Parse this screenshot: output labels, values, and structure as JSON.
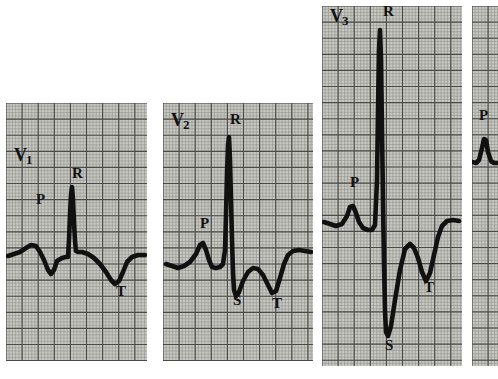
{
  "figure": {
    "kind": "ecg-strip-figure",
    "background_color": "#ffffff",
    "paper_color": "#c9c9c4",
    "trace_color": "#111111",
    "grid_minor_color": "#8e8e88",
    "grid_major_color": "#4a4a46",
    "width": 498,
    "height": 379
  },
  "chart_data": {
    "type": "line",
    "title": "",
    "xlabel": "",
    "ylabel": "",
    "grid": true,
    "legend_position": "none",
    "panels": [
      {
        "lead_label": "V1",
        "lead_label_display": "V",
        "lead_label_subscript": "1",
        "panel_rect": [
          6,
          103,
          141,
          258
        ],
        "baseline_y": 256,
        "annotations": [
          {
            "text": "P",
            "x": 36,
            "y": 204
          },
          {
            "text": "R",
            "x": 72,
            "y": 178
          },
          {
            "text": "T",
            "x": 116,
            "y": 296
          }
        ],
        "features": {
          "p_wave": {
            "amplitude": "small-positive",
            "peak_y": 246
          },
          "q_wave": {
            "amplitude": "small-negative",
            "trough_y": 275
          },
          "r_wave": {
            "amplitude": "tall-narrow-positive",
            "peak_y": 186
          },
          "s_wave": {
            "amplitude": "none"
          },
          "t_wave": {
            "amplitude": "broad-inverted",
            "trough_y": 284
          }
        },
        "points": [
          [
            8,
            256
          ],
          [
            14,
            254
          ],
          [
            20,
            252
          ],
          [
            26,
            248
          ],
          [
            31,
            245
          ],
          [
            36,
            246
          ],
          [
            40,
            252
          ],
          [
            44,
            260
          ],
          [
            48,
            270
          ],
          [
            51,
            274
          ],
          [
            54,
            270
          ],
          [
            57,
            261
          ],
          [
            62,
            258
          ],
          [
            66,
            257
          ],
          [
            68,
            257
          ],
          [
            69,
            240
          ],
          [
            70,
            215
          ],
          [
            71,
            195
          ],
          [
            72,
            187
          ],
          [
            73,
            200
          ],
          [
            74,
            222
          ],
          [
            75,
            241
          ],
          [
            76,
            251
          ],
          [
            78,
            252
          ],
          [
            82,
            252
          ],
          [
            88,
            254
          ],
          [
            94,
            258
          ],
          [
            100,
            264
          ],
          [
            106,
            272
          ],
          [
            111,
            280
          ],
          [
            115,
            284
          ],
          [
            119,
            281
          ],
          [
            123,
            272
          ],
          [
            127,
            262
          ],
          [
            132,
            257
          ],
          [
            138,
            255
          ],
          [
            145,
            255
          ]
        ]
      },
      {
        "lead_label": "V2",
        "lead_label_display": "V",
        "lead_label_subscript": "2",
        "panel_rect": [
          163,
          103,
          150,
          258
        ],
        "baseline_y": 262,
        "annotations": [
          {
            "text": "V2",
            "x": 171,
            "y": 126
          },
          {
            "text": "P",
            "x": 200,
            "y": 228
          },
          {
            "text": "R",
            "x": 230,
            "y": 124
          },
          {
            "text": "S",
            "x": 233,
            "y": 305
          },
          {
            "text": "T",
            "x": 272,
            "y": 308
          }
        ],
        "features": {
          "p_wave": {
            "amplitude": "positive",
            "peak_y": 243
          },
          "r_wave": {
            "amplitude": "very-tall-narrow-positive",
            "peak_y": 136
          },
          "s_wave": {
            "amplitude": "deep-negative",
            "trough_y": 297
          },
          "t_wave": {
            "amplitude": "biphasic-inverted",
            "trough_y": 295
          }
        },
        "points": [
          [
            166,
            264
          ],
          [
            172,
            266
          ],
          [
            178,
            268
          ],
          [
            184,
            266
          ],
          [
            190,
            262
          ],
          [
            196,
            254
          ],
          [
            200,
            245
          ],
          [
            203,
            243
          ],
          [
            206,
            250
          ],
          [
            209,
            260
          ],
          [
            212,
            267
          ],
          [
            216,
            268
          ],
          [
            220,
            267
          ],
          [
            223,
            264
          ],
          [
            225,
            250
          ],
          [
            226,
            215
          ],
          [
            227,
            175
          ],
          [
            228,
            145
          ],
          [
            229,
            137
          ],
          [
            230,
            160
          ],
          [
            231,
            200
          ],
          [
            232,
            240
          ],
          [
            233,
            272
          ],
          [
            234,
            290
          ],
          [
            236,
            296
          ],
          [
            239,
            292
          ],
          [
            243,
            281
          ],
          [
            248,
            272
          ],
          [
            253,
            268
          ],
          [
            258,
            269
          ],
          [
            263,
            275
          ],
          [
            268,
            285
          ],
          [
            272,
            293
          ],
          [
            276,
            291
          ],
          [
            280,
            278
          ],
          [
            284,
            264
          ],
          [
            288,
            255
          ],
          [
            293,
            251
          ],
          [
            299,
            250
          ],
          [
            305,
            251
          ],
          [
            311,
            252
          ]
        ]
      },
      {
        "lead_label": "V3",
        "lead_label_display": "V",
        "lead_label_subscript": "3",
        "panel_rect": [
          322,
          6,
          140,
          360
        ],
        "baseline_y": 222,
        "annotations": [
          {
            "text": "V3",
            "x": 330,
            "y": 22
          },
          {
            "text": "P",
            "x": 350,
            "y": 187
          },
          {
            "text": "R",
            "x": 383,
            "y": 16
          },
          {
            "text": "S",
            "x": 385,
            "y": 350
          },
          {
            "text": "T",
            "x": 424,
            "y": 292
          }
        ],
        "features": {
          "p_wave": {
            "amplitude": "positive",
            "peak_y": 205
          },
          "r_wave": {
            "amplitude": "extremely-tall-narrow-positive",
            "peak_y": 28
          },
          "s_wave": {
            "amplitude": "very-deep-negative",
            "trough_y": 336
          },
          "t_wave": {
            "amplitude": "deeply-inverted",
            "trough_y": 281
          }
        },
        "points": [
          [
            324,
            222
          ],
          [
            330,
            224
          ],
          [
            336,
            226
          ],
          [
            342,
            224
          ],
          [
            347,
            216
          ],
          [
            350,
            207
          ],
          [
            353,
            206
          ],
          [
            356,
            213
          ],
          [
            359,
            222
          ],
          [
            363,
            228
          ],
          [
            368,
            230
          ],
          [
            372,
            230
          ],
          [
            375,
            225
          ],
          [
            377,
            180
          ],
          [
            378,
            110
          ],
          [
            379,
            50
          ],
          [
            380,
            30
          ],
          [
            381,
            60
          ],
          [
            382,
            130
          ],
          [
            383,
            200
          ],
          [
            384,
            265
          ],
          [
            385,
            310
          ],
          [
            386,
            332
          ],
          [
            388,
            336
          ],
          [
            391,
            326
          ],
          [
            395,
            300
          ],
          [
            400,
            270
          ],
          [
            405,
            249
          ],
          [
            410,
            244
          ],
          [
            414,
            248
          ],
          [
            418,
            258
          ],
          [
            422,
            272
          ],
          [
            426,
            281
          ],
          [
            430,
            273
          ],
          [
            434,
            255
          ],
          [
            438,
            237
          ],
          [
            442,
            226
          ],
          [
            447,
            221
          ],
          [
            453,
            220
          ],
          [
            459,
            221
          ]
        ]
      },
      {
        "lead_label": "V4",
        "lead_label_display": "",
        "lead_label_subscript": "",
        "panel_rect": [
          472,
          6,
          26,
          360
        ],
        "baseline_y": 158,
        "clipped": true,
        "annotations": [
          {
            "text": "P",
            "x": 479,
            "y": 120
          }
        ],
        "features": {
          "p_wave": {
            "amplitude": "positive",
            "peak_y": 137
          }
        },
        "points": [
          [
            472,
            162
          ],
          [
            476,
            163
          ],
          [
            479,
            160
          ],
          [
            482,
            148
          ],
          [
            484,
            139
          ],
          [
            486,
            140
          ],
          [
            488,
            152
          ],
          [
            491,
            161
          ],
          [
            494,
            163
          ],
          [
            498,
            163
          ]
        ]
      }
    ]
  }
}
